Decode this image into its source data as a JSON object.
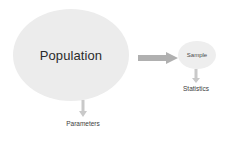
{
  "diagram": {
    "background_color": "#ffffff",
    "population": {
      "label": "Population",
      "shape": "ellipse",
      "fill_color": "#ececec",
      "text_color": "#2b2b2b"
    },
    "sample": {
      "label": "Sample",
      "shape": "ellipse",
      "fill_color": "#eeeeee",
      "text_color": "#4a4a4a"
    },
    "parameters": {
      "label": "Parameters",
      "text_color": "#3d3d3d"
    },
    "statistics": {
      "label": "Statistics",
      "text_color": "#3d3d3d"
    },
    "arrows": {
      "population_to_sample": {
        "name": "sampling-arrow",
        "direction": "right",
        "color": "#b0b0b0"
      },
      "population_to_parameters": {
        "name": "parameters-arrow",
        "direction": "down",
        "color": "#c9c9c9"
      },
      "sample_to_statistics": {
        "name": "statistics-arrow",
        "direction": "down",
        "color": "#c9c9c9"
      }
    }
  }
}
